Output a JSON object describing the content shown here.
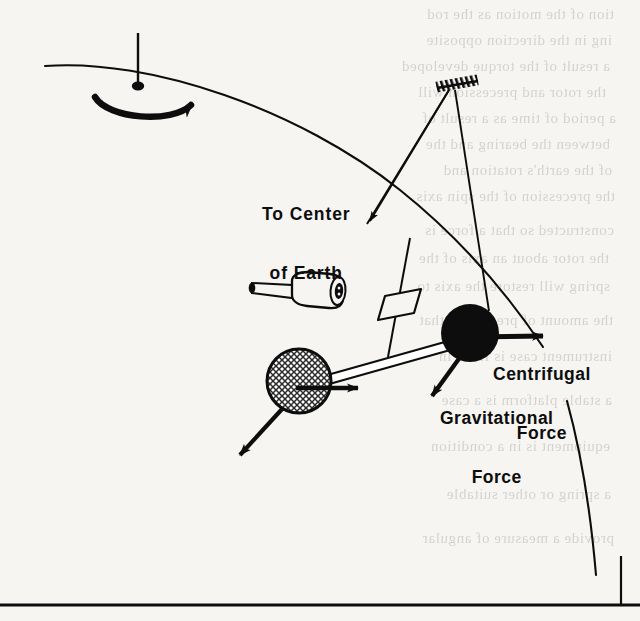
{
  "figure": {
    "caption_labels": {
      "to_center_of_earth_line1": "To Center",
      "to_center_of_earth_line2": "of Earth",
      "centrifugal_force_line1": "Centrifugal",
      "centrifugal_force_line2": "Force",
      "gravitational_force_line1": "Gravitational",
      "gravitational_force_line2": "Force"
    },
    "colors": {
      "ink": "#0d0d0d",
      "paper": "#f6f5f2",
      "ghost_text": "#b9b7b2",
      "hatched_sphere_fill": "#b8b8b8",
      "solid_sphere_fill": "#0d0d0d"
    },
    "elements": {
      "rotation_pivot": "pivot-dot",
      "rotation_axis": "vertical-axis-line",
      "rotation_direction_arrow": "curved-rotation-arrow",
      "earth_surface_curve": "earth-surface-arc",
      "earth_surface_curve_lower": "earth-surface-arc-lower",
      "ceiling_mount": "hatched-ceiling-bracket",
      "suspension_line_left": "suspension-wire-left",
      "suspension_line_right": "suspension-wire-right",
      "plumb_line": "plumb-bob-line",
      "plumb_weight": "plumb-weight-parallelogram",
      "cylinder_device": "cylinder-piston-device",
      "hatched_mass": "cross-hatched-sphere",
      "solid_mass": "solid-black-sphere",
      "connecting_beam": "connecting-rod-beam",
      "arrow_to_center_of_earth": "to-center-of-earth-arrow",
      "arrow_centrifugal": "centrifugal-force-arrow",
      "arrow_gravitational": "gravitational-force-arrow",
      "arrow_hatched_outward": "hatched-mass-outward-arrow",
      "arrow_hatched_downleft": "hatched-mass-gravity-arrow",
      "page_rule_bottom": "bottom-horizontal-rule",
      "page_rule_right": "right-vertical-rule"
    }
  },
  "ghost_text": {
    "lines": [
      "tion of the motion as the rod",
      "ing in the direction opposite",
      "a result of the torque developed",
      "the rotor and precession will",
      "a period of time as a result of",
      "between the bearing and the",
      "of the earth's rotation and",
      "the precession of the spin axis",
      "constructed so that a force is",
      "the rotor about an axis of the",
      "spring will restore the axis to",
      "the amount of precession that",
      "instrument case is fixed in",
      "a stable platform is a case",
      "equipment is in a condition",
      "a spring or other suitable",
      "provide a measure of angular"
    ]
  }
}
